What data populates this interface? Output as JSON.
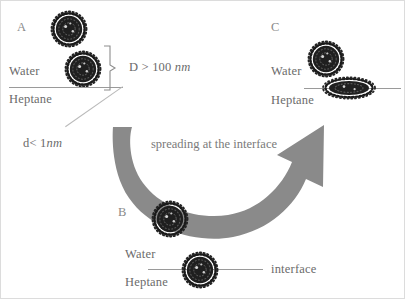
{
  "figure": {
    "background_color": "#ffffff",
    "border_color": "#dcdcdc",
    "particle_color": "#1c1c1c",
    "line_color": "#9a9a9a",
    "arrow_color": "#8a8a8a",
    "text_color": "#6b6b6b"
  },
  "panels": {
    "a": {
      "letter": "A",
      "water_label": "Water",
      "heptane_label": "Heptane",
      "size_label_prefix": "D > 100 ",
      "size_label_unit": "nm",
      "thickness_label_prefix": "d< 1",
      "thickness_label_unit": "nm",
      "particles": [
        {
          "name": "free-particle",
          "shape": "sphere"
        },
        {
          "name": "interface-particle",
          "shape": "sphere"
        }
      ]
    },
    "b": {
      "letter": "B",
      "water_label": "Water",
      "heptane_label": "Heptane",
      "interface_label": "interface",
      "particles": [
        {
          "name": "free-particle",
          "shape": "sphere"
        },
        {
          "name": "adsorbed-particle",
          "shape": "sphere"
        }
      ]
    },
    "c": {
      "letter": "C",
      "water_label": "Water",
      "heptane_label": "Heptane",
      "particles": [
        {
          "name": "free-particle",
          "shape": "sphere"
        },
        {
          "name": "spread-particle",
          "shape": "flattened-ellipse"
        }
      ]
    }
  },
  "arrow": {
    "label": "spreading at the interface",
    "direction": "curved-right-up",
    "color": "#8a8a8a"
  }
}
